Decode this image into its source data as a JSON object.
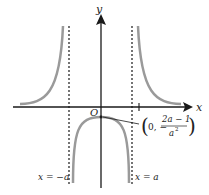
{
  "diagram": {
    "axes": {
      "x_label": "x",
      "y_label": "y",
      "origin_label": "O"
    },
    "asymptotes": {
      "left_label": "x = −a",
      "right_label": "x = a"
    },
    "point_annotation": {
      "open": "(",
      "prefix": "0, −",
      "numerator": "2a − 1",
      "denominator": "a",
      "denominator_exp": "2",
      "close": ")"
    },
    "colors": {
      "curve": "#9a9a9a",
      "axis": "#1a1a1a",
      "asymptote": "#1a1a1a",
      "text": "#222222"
    }
  }
}
